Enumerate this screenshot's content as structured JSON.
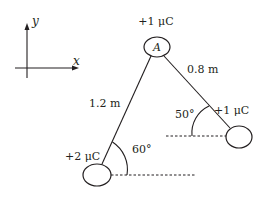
{
  "axes": {
    "x_label": "x",
    "y_label": "y"
  },
  "charges": {
    "A": {
      "name": "A",
      "charge": "+1 μC"
    },
    "left": {
      "charge": "+2 μC"
    },
    "right": {
      "charge": "+1 μC"
    }
  },
  "distances": {
    "A_to_left": "1.2 m",
    "A_to_right": "0.8 m"
  },
  "angles": {
    "left": "60°",
    "right": "50°"
  },
  "colors": {
    "ink": "#231f20",
    "background": "#ffffff"
  }
}
